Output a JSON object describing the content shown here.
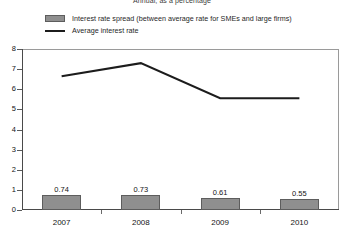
{
  "chart_data": {
    "type": "bar",
    "title": "Annual, as a percentage",
    "xlabel": "",
    "ylabel": "",
    "ylim": [
      0,
      8
    ],
    "ytick_step": 1,
    "yticks": [
      8,
      7,
      6,
      5,
      4,
      3,
      2,
      1,
      0
    ],
    "grid": false,
    "legend_position": "top-left",
    "categories": [
      "2007",
      "2008",
      "2009",
      "2010"
    ],
    "series": [
      {
        "name": "Interest rate spread (between average rate for SMEs and large firms)",
        "type": "bar",
        "values": [
          0.74,
          0.73,
          0.61,
          0.55
        ],
        "labels": [
          "0.74",
          "0.73",
          "0.61",
          "0.55"
        ],
        "color": "#8f8f8f",
        "edge_color": "#5d5d5d"
      },
      {
        "name": "Average interest rate",
        "type": "line",
        "values": [
          6.65,
          7.3,
          5.55,
          5.55
        ],
        "color": "#1c1c1c"
      }
    ]
  },
  "legend": {
    "items": [
      {
        "label": "Interest rate spread (between average rate for SMEs and large firms)",
        "swatch": "box"
      },
      {
        "label": "Average interest rate",
        "swatch": "line"
      }
    ]
  }
}
